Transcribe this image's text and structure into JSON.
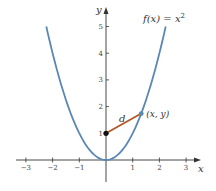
{
  "chart_data": {
    "type": "line",
    "title": "",
    "function_label": "f(x) = x",
    "function_exponent": "2",
    "xlabel": "x",
    "ylabel": "y",
    "xlim": [
      -3.5,
      3.5
    ],
    "ylim": [
      -0.9,
      5.6
    ],
    "x_ticks": [
      -3,
      -2,
      -1,
      1,
      2,
      3
    ],
    "x_tick_labels": [
      "−3",
      "−2",
      "−1",
      "1",
      "2",
      "3"
    ],
    "y_ticks": [
      1,
      2,
      3,
      4,
      5
    ],
    "y_tick_labels": [
      "1",
      "2",
      "3",
      "4",
      "5"
    ],
    "grid": false,
    "series": [
      {
        "name": "f(x) = x^2",
        "kind": "curve",
        "color": "#5b87b5",
        "x_range": [
          -2.236,
          2.236
        ],
        "x": [
          -2.236,
          -2,
          -1.5,
          -1,
          -0.5,
          0,
          0.5,
          1,
          1.5,
          2,
          2.236
        ],
        "values": [
          5,
          4,
          2.25,
          1,
          0.25,
          0,
          0.25,
          1,
          2.25,
          4,
          5
        ]
      },
      {
        "name": "d",
        "kind": "segment",
        "color": "#b5562a",
        "x": [
          0,
          1.32
        ],
        "values": [
          1,
          1.74
        ]
      }
    ],
    "points": [
      {
        "label": "",
        "x": 0,
        "y": 1,
        "color": "#111111"
      },
      {
        "label": "(x, y)",
        "x": 1.32,
        "y": 1.74,
        "color": "#5b87b5"
      }
    ],
    "annotations": [
      {
        "text": "d",
        "x": 0.6,
        "y": 1.55
      }
    ]
  },
  "layout": {
    "origin_px": [
      106,
      160
    ],
    "unit_px": 26.7
  }
}
